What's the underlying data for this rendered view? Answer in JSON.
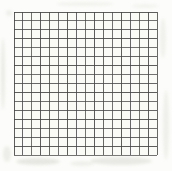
{
  "canvas": {
    "width": 172,
    "height": 171,
    "background": "#fcfcfa"
  },
  "grid": {
    "columns": 16,
    "rows": 16,
    "left": 14,
    "top": 12,
    "width": 143,
    "height": 143,
    "line_color": "#474747",
    "line_width": 1,
    "line_opacity": 0.88,
    "paper_fill": "#fafaf7"
  },
  "noise": {
    "color": "#d6d6cf",
    "spots": [
      {
        "x": 1,
        "y": 38,
        "w": 4,
        "h": 72,
        "o": 0.45
      },
      {
        "x": 3,
        "y": 146,
        "w": 8,
        "h": 16,
        "o": 0.4
      },
      {
        "x": 16,
        "y": 158,
        "w": 44,
        "h": 7,
        "o": 0.55
      },
      {
        "x": 70,
        "y": 161,
        "w": 24,
        "h": 5,
        "o": 0.35
      },
      {
        "x": 90,
        "y": 157,
        "w": 62,
        "h": 8,
        "o": 0.5
      },
      {
        "x": 160,
        "y": 18,
        "w": 6,
        "h": 40,
        "o": 0.3
      },
      {
        "x": 163,
        "y": 90,
        "w": 6,
        "h": 70,
        "o": 0.35
      },
      {
        "x": 56,
        "y": 2,
        "w": 58,
        "h": 4,
        "o": 0.28
      },
      {
        "x": 132,
        "y": 4,
        "w": 26,
        "h": 4,
        "o": 0.25
      },
      {
        "x": 6,
        "y": 10,
        "w": 6,
        "h": 6,
        "o": 0.35
      }
    ]
  }
}
